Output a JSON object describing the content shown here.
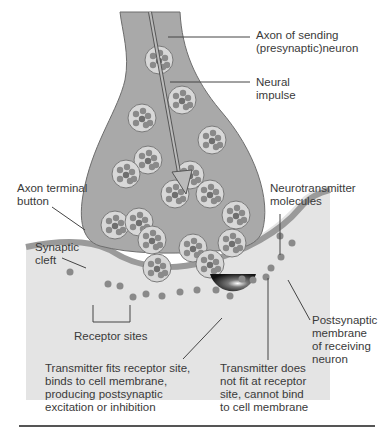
{
  "diagram": {
    "type": "labeled-anatomy",
    "labels": {
      "axon": "Axon of sending\n(presynaptic)neuron",
      "neural_impulse": "Neural\nimpulse",
      "axon_terminal": "Axon terminal\nbutton",
      "neurotransmitter": "Neurotransmitter\nmolecules",
      "synaptic_cleft": "Synaptic\ncleft",
      "receptor_sites": "Receptor sites",
      "postsynaptic_membrane": "Postsynaptic\nmembrane\nof receiving\nneuron",
      "fits": "Transmitter fits receptor site,\nbinds to cell membrane,\nproducing postsynaptic\nexcitation or inhibition",
      "not_fit": "Transmitter does\nnot fit at receptor\nsite, cannot bind\nto cell membrane"
    },
    "colors": {
      "axon_fill": "#a9a9a9",
      "axon_stroke": "#6d6d6d",
      "vesicle_fill": "#d8d8d8",
      "molecule_fill": "#8a8a8a",
      "cleft": "#ffffff",
      "postsynaptic_fill": "#e4e4e4",
      "membrane": "#9a9a9a"
    }
  }
}
